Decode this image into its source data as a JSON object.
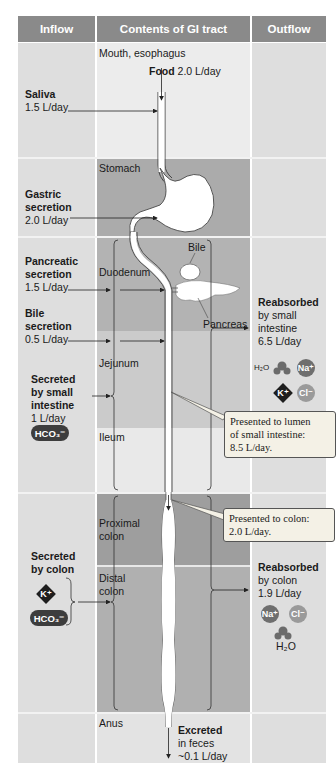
{
  "headers": {
    "inflow": "Inflow",
    "contents": "Contents of GI tract",
    "outflow": "Outflow"
  },
  "segments": {
    "mouth": "Mouth, esophagus",
    "stomach": "Stomach",
    "duodenum": "Duodenum",
    "jejunum": "Jejunum",
    "ileum": "Ileum",
    "proximal_colon": [
      "Proximal",
      "colon"
    ],
    "distal_colon": [
      "Distal",
      "colon"
    ],
    "anus": "Anus"
  },
  "organs": {
    "bile": "Bile",
    "pancreas": "Pancreas"
  },
  "food": {
    "label": "Food",
    "value": "2.0 L/day"
  },
  "inflow": {
    "saliva": {
      "title": "Saliva",
      "value": "1.5 L/day"
    },
    "gastric": {
      "title": [
        "Gastric",
        "secretion"
      ],
      "value": "2.0 L/day"
    },
    "pancreatic": {
      "title": [
        "Pancreatic",
        "secretion"
      ],
      "value": "1.5 L/day"
    },
    "bile": {
      "title": [
        "Bile",
        "secretion"
      ],
      "value": "0.5 L/day"
    },
    "small_intestine": {
      "title": [
        "Secreted",
        "by small",
        "intestine"
      ],
      "value": "1 L/day",
      "ion": "HCO₃⁻"
    },
    "colon": {
      "title": [
        "Secreted",
        "by colon"
      ],
      "ions": [
        "K⁺",
        "HCO₃⁻"
      ]
    }
  },
  "outflow": {
    "small_intestine": {
      "title": "Reabsorbed",
      "lines": [
        "by small",
        "intestine"
      ],
      "value": "6.5 L/day",
      "ions": [
        "H₂O",
        "Na⁺",
        "K⁺",
        "Cl⁻"
      ]
    },
    "colon": {
      "title": "Reabsorbed",
      "lines": [
        "by colon"
      ],
      "value": "1.9 L/day",
      "ions": [
        "Na⁺",
        "Cl⁻",
        "H₂O"
      ]
    },
    "excreted": {
      "title": "Excreted",
      "lines": [
        "in feces"
      ],
      "value": "~0.1 L/day"
    }
  },
  "callouts": {
    "small_intestine": [
      "Presented to lumen",
      "of small intestine:",
      "8.5 L/day."
    ],
    "colon": [
      "Presented to colon:",
      "2.0 L/day."
    ]
  },
  "colors": {
    "header": "#8a8a8a",
    "side_light": "#dcdcdc",
    "mid_light": "#e6e6e6",
    "mid_dark": "#a9a9a9",
    "mid_medium": "#c8c8c8",
    "ion_na": "#6e6e6e",
    "ion_cl": "#9a9a9a"
  }
}
